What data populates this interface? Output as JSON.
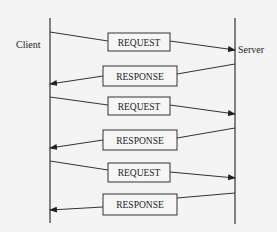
{
  "diagram": {
    "type": "sequence",
    "participants": [
      {
        "id": "client",
        "label": "Client"
      },
      {
        "id": "server",
        "label": "Server"
      }
    ],
    "messages": [
      {
        "label": "REQUEST",
        "from": "client",
        "to": "server"
      },
      {
        "label": "RESPONSE",
        "from": "server",
        "to": "client"
      },
      {
        "label": "REQUEST",
        "from": "client",
        "to": "server"
      },
      {
        "label": "RESPONSE",
        "from": "server",
        "to": "client"
      },
      {
        "label": "REQUEST",
        "from": "client",
        "to": "server"
      },
      {
        "label": "RESPONSE",
        "from": "server",
        "to": "client"
      }
    ]
  },
  "colors": {
    "background": "#f4f4f4",
    "line": "#333333",
    "box_fill": "#f6f6f6"
  }
}
